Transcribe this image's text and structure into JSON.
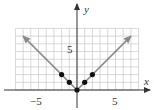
{
  "chart_data": {
    "type": "line",
    "title": "",
    "function": "y = |x|",
    "xlabel": "x",
    "ylabel": "y",
    "xlim": [
      -8,
      8
    ],
    "ylim": [
      -2,
      10
    ],
    "grid_x_range": [
      -8,
      8
    ],
    "grid_y_range": [
      0,
      8
    ],
    "grid": true,
    "x_ticks_labeled": [
      -5,
      5
    ],
    "y_ticks_labeled": [
      5
    ],
    "x_tick_labels": [
      "−5",
      "5"
    ],
    "y_tick_labels": [
      "5"
    ],
    "series": [
      {
        "name": "y = |x|",
        "x": [
          -7,
          0,
          7
        ],
        "y": [
          7,
          0,
          7
        ],
        "style": "line with arrowheads at both ends",
        "color": "#8a8a8a"
      },
      {
        "name": "plotted points",
        "x": [
          -2,
          -1,
          0,
          1,
          2
        ],
        "y": [
          2,
          1,
          0,
          1,
          2
        ],
        "style": "scatter",
        "color": "#111111"
      }
    ]
  },
  "labels": {
    "x_axis": "x",
    "y_axis": "y",
    "x_tick_neg5": "−5",
    "x_tick_5": "5",
    "y_tick_5": "5"
  },
  "colors": {
    "grid": "#c8c8c8",
    "axis": "#333333",
    "line": "#8a8a8a",
    "points": "#111111"
  }
}
